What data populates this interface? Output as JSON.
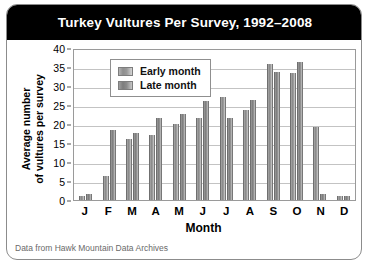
{
  "figure": {
    "title": "Turkey Vultures Per Survey, 1992–2008",
    "source_note": "Data from Hawk Mountain Data Archives",
    "title_bar_color": "#000000",
    "title_text_color": "#ffffff",
    "panel_background": "#ffffff"
  },
  "chart_data": {
    "type": "bar",
    "title": "Turkey Vultures Per Survey, 1992–2008",
    "xlabel": "Month",
    "ylabel": "Average number of vultures per survey",
    "ylabel_lines": [
      "Average number",
      "of vultures per survey"
    ],
    "categories": [
      "J",
      "F",
      "M",
      "A",
      "M",
      "J",
      "J",
      "A",
      "S",
      "O",
      "N",
      "D"
    ],
    "series": [
      {
        "name": "Early month",
        "color": "#9a9a9a",
        "values": [
          1.0,
          6.3,
          16.0,
          17.1,
          20.1,
          21.6,
          27.0,
          23.6,
          35.8,
          33.3,
          19.2,
          1.0
        ]
      },
      {
        "name": "Late month",
        "color": "#838383",
        "values": [
          1.7,
          18.4,
          17.7,
          21.6,
          22.6,
          26.0,
          21.6,
          26.3,
          33.8,
          36.4,
          1.6,
          1.1
        ]
      }
    ],
    "ylim": [
      0,
      40
    ],
    "yticks": [
      0,
      5,
      10,
      15,
      20,
      25,
      30,
      35,
      40
    ],
    "grid": true,
    "legend_position": "upper left",
    "legend_entries": [
      "Early month",
      "Late month"
    ]
  }
}
